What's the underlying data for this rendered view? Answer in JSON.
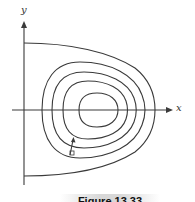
{
  "diagram": {
    "axes": {
      "x_label": "x",
      "y_label": "y"
    },
    "colors": {
      "line": "#3a3a3a",
      "background": "#ffffff"
    },
    "curves": {
      "outer_boundary": "open curve bounded by y-axis",
      "closed_orbits_count": 4
    },
    "caption": "Figure 13.33"
  }
}
